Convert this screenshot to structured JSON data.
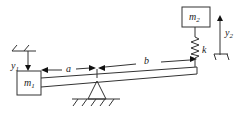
{
  "diagram": {
    "type": "mechanical-system",
    "labels": {
      "mass1": "m",
      "mass1_sub": "1",
      "mass2": "m",
      "mass2_sub": "2",
      "disp1": "y",
      "disp1_sub": "1",
      "disp2": "y",
      "disp2_sub": "2",
      "dim_a": "a",
      "dim_b": "b",
      "spring": "k"
    },
    "colors": {
      "line": "#333333",
      "background": "#ffffff"
    }
  }
}
